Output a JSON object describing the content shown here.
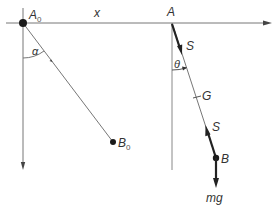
{
  "diagram": {
    "type": "pendulum free-body diagram",
    "colors": {
      "line": "#6e6e6e",
      "thick": "#222222",
      "text": "#333333"
    },
    "labels": {
      "a0": "A",
      "a0_sub": "0",
      "x": "x",
      "a": "A",
      "alpha": "α",
      "b0": "B",
      "b0_sub": "0",
      "s_top": "S",
      "theta": "θ",
      "g": "G",
      "s_bottom": "S",
      "b": "B",
      "mg": "mg"
    }
  }
}
